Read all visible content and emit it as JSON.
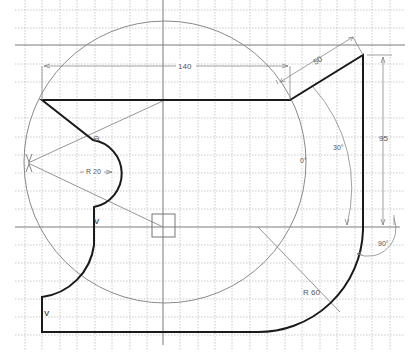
{
  "sketch": {
    "grid": {
      "x_lines": [
        25,
        42,
        60,
        77,
        95,
        112,
        130,
        147,
        180,
        198,
        215,
        232,
        250,
        267,
        285,
        302,
        320,
        337,
        355,
        372,
        390,
        405
      ],
      "y_lines": [
        10,
        28,
        64,
        82,
        100,
        118,
        137,
        155,
        173,
        191,
        209,
        245,
        263,
        281,
        299,
        317,
        335
      ],
      "color": "#b8b8b8"
    },
    "axes": {
      "horizontal_y": [
        45,
        227
      ],
      "vertical_x": [
        163
      ],
      "color": "#777777"
    },
    "colors": {
      "profile": "#1a1a1a",
      "construction": "#8a8a8a",
      "dimension": "#888888",
      "text": "#555555"
    },
    "dimensions": {
      "width_top": "140",
      "slant_length": "50",
      "right_height": "95",
      "slant_angle": "30°",
      "zero_angle": "0°",
      "right_angle": "90°",
      "small_radius": "R 20",
      "large_radius": "R 60"
    },
    "constraint_marks": {
      "vertical_1": "V",
      "vertical_2": "V",
      "tangent": "⊖"
    }
  }
}
